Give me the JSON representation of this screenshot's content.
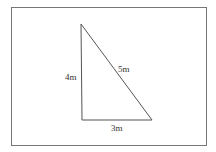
{
  "figure": {
    "type": "right-triangle",
    "frame": {
      "x": 11,
      "y": 7,
      "width": 196,
      "height": 139,
      "color": "#777777"
    },
    "vertices": {
      "top": [
        81,
        24
      ],
      "bottom_left": [
        82,
        120
      ],
      "bottom_right": [
        152,
        120
      ]
    },
    "stroke_color": "#555555",
    "labels": {
      "vertical_side": "4m",
      "hypotenuse": "5m",
      "base": "3m"
    }
  }
}
